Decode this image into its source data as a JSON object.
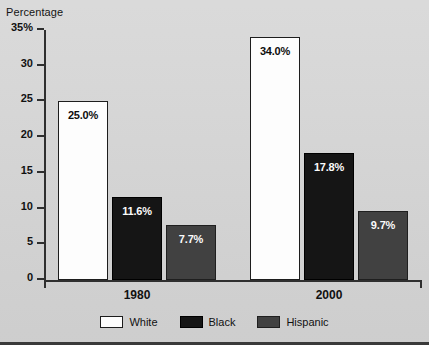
{
  "chart_data": {
    "type": "bar",
    "title": "",
    "ylabel": "Percentage",
    "xlabel": "",
    "ylim": [
      0,
      35
    ],
    "grid": false,
    "legend_position": "bottom-center",
    "categories": [
      "1980",
      "2000"
    ],
    "ytick_labels": [
      "35%",
      "30",
      "25",
      "20",
      "15",
      "10",
      "5",
      "0"
    ],
    "ytick_values": [
      35,
      30,
      25,
      20,
      15,
      10,
      5,
      0
    ],
    "series": [
      {
        "name": "White",
        "color": "#fdfdfd",
        "values": [
          25.0,
          34.0
        ],
        "data_labels": [
          "25.0%",
          "34.0%"
        ]
      },
      {
        "name": "Black",
        "color": "#151515",
        "values": [
          11.6,
          17.8
        ],
        "data_labels": [
          "11.6%",
          "17.8%"
        ]
      },
      {
        "name": "Hispanic",
        "color": "#414141",
        "values": [
          7.7,
          9.7
        ],
        "data_labels": [
          "7.7%",
          "9.7%"
        ]
      }
    ]
  },
  "legend": {
    "items": [
      {
        "label": "White"
      },
      {
        "label": "Black"
      },
      {
        "label": "Hispanic"
      }
    ]
  },
  "colors": {
    "background": "#d6d6d6",
    "axis": "#2f2f2f",
    "text": "#111111",
    "white_series": "#fdfdfd",
    "black_series": "#151515",
    "hispanic_series": "#414141"
  }
}
